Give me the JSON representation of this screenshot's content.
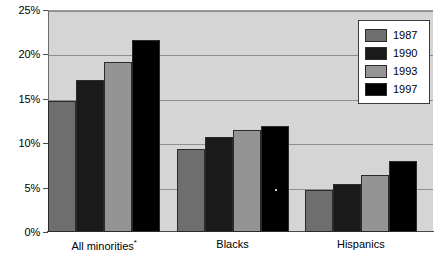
{
  "chart_data": {
    "type": "bar",
    "title": "",
    "xlabel": "",
    "ylabel": "",
    "categories": [
      "All minorities*",
      "Blacks",
      "Hispanics"
    ],
    "series": [
      {
        "name": "1987",
        "color": "#6e6e6e",
        "values": [
          14.7,
          9.4,
          4.7
        ]
      },
      {
        "name": "1990",
        "color": "#1a1a1a",
        "values": [
          17.1,
          10.7,
          5.4
        ]
      },
      {
        "name": "1993",
        "color": "#949494",
        "values": [
          19.2,
          11.5,
          6.4
        ]
      },
      {
        "name": "1997",
        "color": "#000000",
        "values": [
          21.6,
          11.9,
          8.0
        ]
      }
    ],
    "ylim": [
      0,
      25
    ],
    "y_ticks": [
      0,
      5,
      10,
      15,
      20,
      25
    ],
    "y_tick_labels": [
      "0%",
      "5%",
      "10%",
      "15%",
      "20%",
      "25%"
    ],
    "grid": true,
    "legend_position": "top-right",
    "plot_background": "#d5d5d5",
    "gridline_color": "#8e8e8e"
  },
  "legend": {
    "entries": [
      {
        "label": "1987"
      },
      {
        "label": "1990"
      },
      {
        "label": "1993"
      },
      {
        "label": "1997"
      }
    ]
  }
}
